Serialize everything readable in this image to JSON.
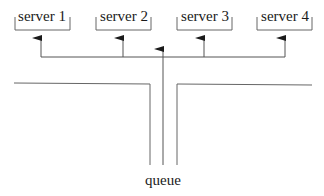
{
  "diagram": {
    "type": "queueing-system",
    "servers": [
      {
        "label": "server 1"
      },
      {
        "label": "server 2"
      },
      {
        "label": "server 3"
      },
      {
        "label": "server 4"
      }
    ],
    "queue": {
      "label": "queue"
    },
    "colors": {
      "line": "#555555",
      "arrow": "#1a1a1a",
      "text": "#1a1a1a",
      "background": "#ffffff"
    }
  }
}
